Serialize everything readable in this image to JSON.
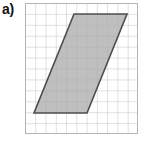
{
  "figure": {
    "part_label": "a)",
    "width": 145,
    "height": 141,
    "background_color": "#ffffff"
  },
  "grid": {
    "name": "square-grid",
    "origin_x": 25,
    "origin_y": 3,
    "width": 113,
    "height": 131,
    "columns": 11,
    "rows": 12,
    "cell_width": 10.27,
    "cell_height": 10.92,
    "line_color": "#c3c3c3",
    "border_color": "#b4b4b4",
    "line_width": 1
  },
  "chart_data": {
    "type": "scatter",
    "title": "a)",
    "xlabel": "",
    "ylabel": "",
    "grid": true,
    "legend_position": "none",
    "xlim": [
      0,
      11
    ],
    "ylim": [
      0,
      12
    ],
    "shapes": [
      {
        "name": "parallelogram",
        "kind": "parallelogram",
        "fill_color": "#a9a9a9",
        "fill_opacity": 0.75,
        "stroke_color": "#4d4d4d",
        "stroke_width": 1.6,
        "vertices_px": [
          [
            49,
            11
          ],
          [
            102,
            11
          ],
          [
            62,
            110
          ],
          [
            9,
            110
          ]
        ],
        "vertices_grid": [
          [
            4.8,
            11.0
          ],
          [
            9.9,
            11.0
          ],
          [
            6.0,
            1.9
          ],
          [
            0.9,
            1.9
          ]
        ],
        "base_cells": 5,
        "height_cells": 9,
        "slant_cells": 4
      }
    ]
  }
}
